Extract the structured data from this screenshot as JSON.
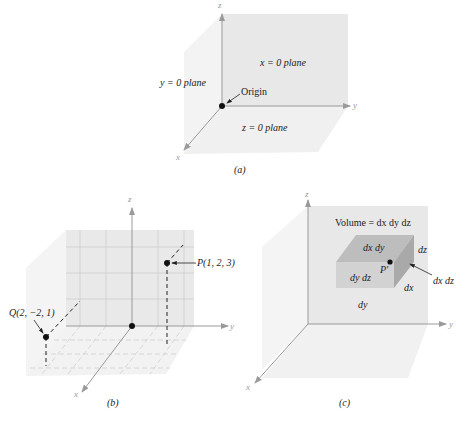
{
  "figure_a": {
    "caption": "(a)",
    "axes": {
      "x": "x",
      "y": "y",
      "z": "z"
    },
    "labels": {
      "x_plane": "x = 0 plane",
      "y_plane": "y = 0 plane",
      "z_plane": "z = 0 plane",
      "origin": "Origin"
    }
  },
  "figure_b": {
    "caption": "(b)",
    "axes": {
      "x": "x",
      "y": "y",
      "z": "z"
    },
    "points": [
      {
        "label": "P(1, 2, 3)",
        "x": 1,
        "y": 2,
        "z": 3
      },
      {
        "label": "Q(2, −2, 1)",
        "x": 2,
        "y": -2,
        "z": 1
      }
    ]
  },
  "figure_c": {
    "caption": "(c)",
    "axes": {
      "x": "x",
      "y": "y",
      "z": "z"
    },
    "labels": {
      "volume": "Volume = dx dy dz",
      "top_face": "dx dy",
      "front_face": "dy dz",
      "side_face": "dx dz",
      "edge_dz": "dz",
      "edge_dx": "dx",
      "edge_dy": "dy",
      "point": "P′"
    }
  },
  "colors": {
    "plane_light": "#f1f1f1",
    "plane_mid": "#e6e6e6",
    "axis": "#9a9a9a",
    "grid": "#c9c9c9",
    "cube_top": "#b9b9b9",
    "cube_front": "#cfcfcf",
    "cube_side": "#a8a8a8",
    "point": "#111111"
  }
}
